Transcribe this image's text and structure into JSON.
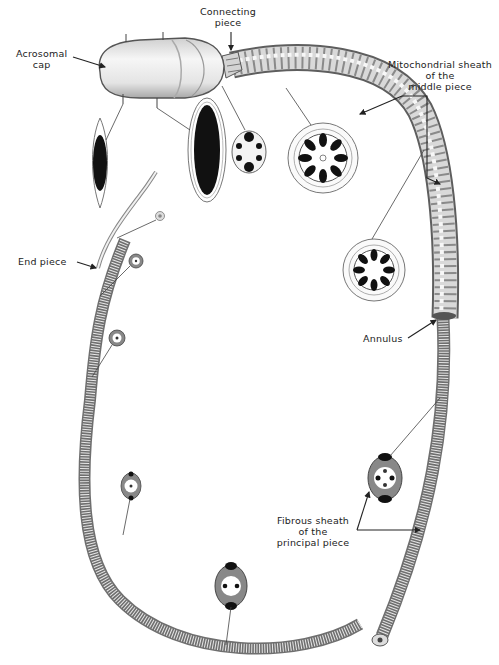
{
  "labels": {
    "acrosomal_cap": [
      "Acrosomal",
      "cap"
    ],
    "connecting_piece": [
      "Connecting",
      "piece"
    ],
    "mitochondrial_sheath": [
      "Mitochondrial sheath",
      "of the",
      "middle piece"
    ],
    "end_piece": [
      "End piece"
    ],
    "annulus": [
      "Annulus"
    ],
    "fibrous_sheath": [
      "Fibrous sheath",
      "of the",
      "principal piece"
    ]
  },
  "parts": [
    {
      "id": "head",
      "name": "Head with acrosomal cap"
    },
    {
      "id": "neck",
      "name": "Connecting piece"
    },
    {
      "id": "middle",
      "name": "Middle piece (mitochondrial sheath)"
    },
    {
      "id": "annulus",
      "name": "Annulus"
    },
    {
      "id": "principal",
      "name": "Principal piece (fibrous sheath)"
    },
    {
      "id": "end",
      "name": "End piece"
    }
  ],
  "cross_sections": [
    {
      "id": "head-xs-1",
      "region": "head"
    },
    {
      "id": "head-xs-2",
      "region": "head"
    },
    {
      "id": "neck-xs",
      "region": "connecting piece"
    },
    {
      "id": "middle-xs-1",
      "region": "middle piece"
    },
    {
      "id": "middle-xs-2",
      "region": "middle piece"
    },
    {
      "id": "principal-xs-1",
      "region": "principal piece"
    },
    {
      "id": "principal-xs-2",
      "region": "principal piece"
    },
    {
      "id": "principal-xs-3",
      "region": "principal piece"
    },
    {
      "id": "tail-xs-1",
      "region": "principal piece"
    },
    {
      "id": "tail-xs-2",
      "region": "end piece"
    },
    {
      "id": "tail-xs-3",
      "region": "end piece"
    },
    {
      "id": "cut-end",
      "region": "principal piece"
    }
  ],
  "colors": {
    "ink": "#222222",
    "body_light": "#ececec",
    "body_shade": "#9a9a9a",
    "nucleus": "#111111"
  }
}
